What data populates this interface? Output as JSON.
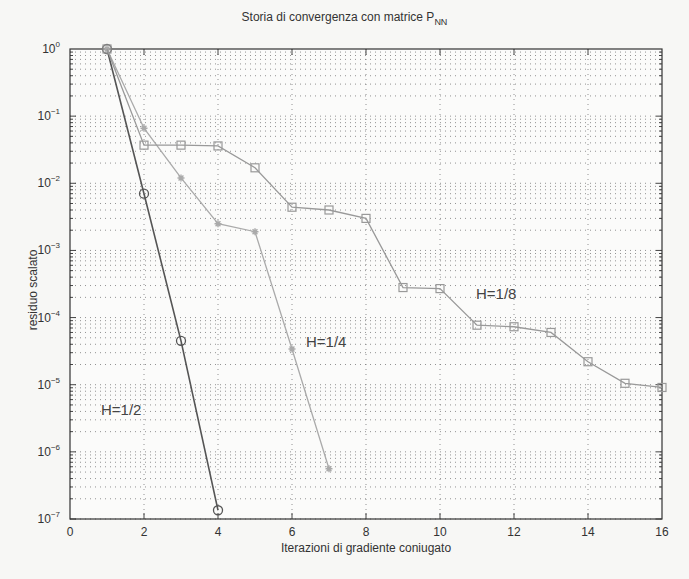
{
  "chart_data": {
    "type": "line",
    "title": "Storia di convergenza con matrice P",
    "title_subscript": "NN",
    "xlabel": "Iterazioni di gradiente coniugato",
    "ylabel": "residuo scalato",
    "xlim": [
      0,
      16
    ],
    "ylim": [
      1e-07,
      1
    ],
    "yscale": "log",
    "grid": true,
    "xticks": [
      "0",
      "2",
      "4",
      "6",
      "8",
      "10",
      "12",
      "14",
      "16"
    ],
    "yticks": [
      "10^0",
      "10^-1",
      "10^-2",
      "10^-3",
      "10^-4",
      "10^-5",
      "10^-6",
      "10^-7"
    ],
    "series": [
      {
        "name": "H=1/2",
        "marker": "circle",
        "color": "#555555",
        "x": [
          1,
          2,
          3,
          4
        ],
        "values": [
          1.0,
          0.007,
          4.5e-05,
          1.35e-07
        ]
      },
      {
        "name": "H=1/4",
        "marker": "star",
        "color": "#aaaaaa",
        "x": [
          1,
          2,
          3,
          4,
          5,
          6,
          7
        ],
        "values": [
          1.0,
          0.066,
          0.012,
          0.0025,
          0.0019,
          3.4e-05,
          5.6e-07
        ]
      },
      {
        "name": "H=1/8",
        "marker": "square",
        "color": "#999999",
        "x": [
          1,
          2,
          3,
          4,
          5,
          6,
          7,
          8,
          9,
          10,
          11,
          12,
          13,
          14,
          15,
          16
        ],
        "values": [
          1.0,
          0.037,
          0.037,
          0.036,
          0.017,
          0.0044,
          0.004,
          0.003,
          0.00028,
          0.00027,
          7.7e-05,
          7.3e-05,
          6e-05,
          2.2e-05,
          1.05e-05,
          9.1e-06
        ]
      }
    ],
    "annotations": [
      {
        "text": "H=1/2",
        "x": 1.0,
        "y": 4e-06
      },
      {
        "text": "H=1/4",
        "x": 6.2,
        "y": 2.5e-05
      },
      {
        "text": "H=1/8",
        "x": 11.0,
        "y": 0.00014
      }
    ]
  },
  "labels": {
    "title": "Storia di convergenza con matrice P",
    "title_sub": "NN",
    "xlabel": "Iterazioni di gradiente coniugato",
    "ylabel": "residuo scalato",
    "annot_h2": "H=1/2",
    "annot_h4": "H=1/4",
    "annot_h8": "H=1/8"
  }
}
